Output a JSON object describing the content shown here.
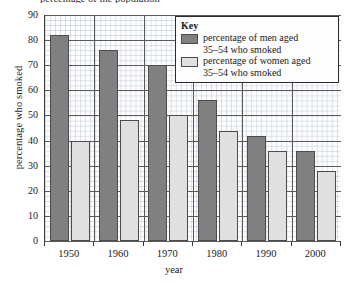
{
  "figure": {
    "caption_partial": "percentage of the population",
    "x_axis_title": "year",
    "y_axis_title": "percentage who smoked"
  },
  "legend": {
    "title": "Key",
    "entries": [
      {
        "label": "percentage of men aged 35–54 who smoked",
        "line1": "percentage of men aged",
        "line2": "35–54 who smoked",
        "color": "#808080",
        "swatch_name": "men-swatch"
      },
      {
        "label": "percentage of women aged 35–54 who smoked",
        "line1": "percentage of women aged",
        "line2": "35–54 who smoked",
        "color": "#e0e0e0",
        "swatch_name": "women-swatch"
      }
    ]
  },
  "chart_data": {
    "type": "bar",
    "title": "",
    "xlabel": "year",
    "ylabel": "percentage who smoked",
    "categories": [
      "1950",
      "1960",
      "1970",
      "1980",
      "1990",
      "2000"
    ],
    "series": [
      {
        "name": "percentage of men aged 35–54 who smoked",
        "color": "#808080",
        "values": [
          82,
          76,
          70,
          56,
          42,
          36
        ]
      },
      {
        "name": "percentage of women aged 35–54 who smoked",
        "color": "#e0e0e0",
        "values": [
          40,
          48,
          50,
          44,
          36,
          28
        ]
      }
    ],
    "ylim": [
      0,
      90
    ],
    "ytick_step": 10,
    "yticks": [
      0,
      10,
      20,
      30,
      40,
      50,
      60,
      70,
      80,
      90
    ],
    "ytick_labels": [
      "0",
      "10",
      "20",
      "30",
      "40",
      "50",
      "60",
      "70",
      "80",
      "90"
    ],
    "grid": true,
    "minor_grid": true,
    "legend_position": "top-right"
  }
}
